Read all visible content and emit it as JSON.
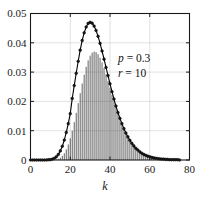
{
  "chart_data": {
    "type": "bar",
    "title": "",
    "subtitle": "",
    "xlabel": "k",
    "ylabel": "",
    "xlim": [
      0,
      80
    ],
    "ylim": [
      0,
      0.05
    ],
    "grid": true,
    "legend": null,
    "x_ticks": [
      "0",
      "20",
      "40",
      "60",
      "80"
    ],
    "x_tick_values": [
      0,
      20,
      40,
      60,
      80
    ],
    "y_ticks": [
      "0",
      "0.01",
      "0.02",
      "0.03",
      "0.04",
      "0.05"
    ],
    "y_tick_values": [
      0,
      0.01,
      0.02,
      0.03,
      0.04,
      0.05
    ],
    "marker": "circle",
    "stems": true,
    "annotations": [
      {
        "name": "p-annotation",
        "variable": "p",
        "equals": " = ",
        "value": "0.3",
        "x": 44,
        "y": 0.0335
      },
      {
        "name": "r-annotation",
        "variable": "r",
        "equals": " = ",
        "value": "10",
        "x": 44,
        "y": 0.0285
      }
    ],
    "categories": [
      0,
      1,
      2,
      3,
      4,
      5,
      6,
      7,
      8,
      9,
      10,
      11,
      12,
      13,
      14,
      15,
      16,
      17,
      18,
      19,
      20,
      21,
      22,
      23,
      24,
      25,
      26,
      27,
      28,
      29,
      30,
      31,
      32,
      33,
      34,
      35,
      36,
      37,
      38,
      39,
      40,
      41,
      42,
      43,
      44,
      45,
      46,
      47,
      48,
      49,
      50,
      51,
      52,
      53,
      54,
      55,
      56,
      57,
      58,
      59,
      60,
      61,
      62,
      63,
      64,
      65,
      66,
      67,
      68,
      69,
      70,
      71,
      72,
      73,
      74,
      75
    ],
    "values": [
      0.0,
      0.0,
      0.0,
      0.0,
      0.0,
      0.0,
      0.0,
      0.0,
      0.0,
      0.0,
      0.0,
      0.0,
      0.0001,
      0.0002,
      0.0004,
      0.0008,
      0.0014,
      0.0023,
      0.0036,
      0.0053,
      0.0074,
      0.01,
      0.0129,
      0.0161,
      0.0194,
      0.0228,
      0.0261,
      0.0291,
      0.0318,
      0.034,
      0.0356,
      0.0366,
      0.037,
      0.0368,
      0.0361,
      0.0349,
      0.0333,
      0.0314,
      0.0293,
      0.027,
      0.0247,
      0.0223,
      0.02,
      0.0178,
      0.0157,
      0.0137,
      0.0119,
      0.0103,
      0.0088,
      0.0075,
      0.0063,
      0.0053,
      0.0044,
      0.0037,
      0.003,
      0.0025,
      0.002,
      0.0017,
      0.0013,
      0.0011,
      0.0009,
      0.0007,
      0.0006,
      0.0004,
      0.0004,
      0.0003,
      0.0002,
      0.0002,
      0.0001,
      0.0001,
      0.0001,
      0.0001,
      0.0,
      0.0,
      0.0,
      0.0
    ],
    "curve_values": [
      0.0,
      0.0,
      0.0,
      0.0,
      0.0,
      0.0,
      0.0,
      0.0,
      0.0,
      0.0001,
      0.0001,
      0.0003,
      0.0006,
      0.0011,
      0.0019,
      0.0031,
      0.0047,
      0.0068,
      0.0094,
      0.0124,
      0.0158,
      0.021,
      0.0254,
      0.0296,
      0.0337,
      0.0375,
      0.0408,
      0.0434,
      0.0454,
      0.0466,
      0.047,
      0.0467,
      0.0457,
      0.0442,
      0.0422,
      0.0398,
      0.0372,
      0.0344,
      0.0316,
      0.0288,
      0.026,
      0.0233,
      0.0208,
      0.0184,
      0.0162,
      0.0142,
      0.0124,
      0.0107,
      0.0092,
      0.0079,
      0.0067,
      0.0057,
      0.0048,
      0.004,
      0.0034,
      0.0028,
      0.0023,
      0.0019,
      0.0016,
      0.0013,
      0.0011,
      0.0009,
      0.0007,
      0.0006,
      0.0005,
      0.0004,
      0.0003,
      0.0003,
      0.0002,
      0.0002,
      0.0001,
      0.0001,
      0.0001,
      0.0001,
      0.0001,
      0.0
    ]
  },
  "colors": {
    "axis": "#1a1a1a",
    "grid": "#d6d6d6",
    "stem": "#2b2b2b",
    "marker_fill": "#1a1a1a",
    "marker_stroke": "#000000",
    "curve": "#000000",
    "background": "#ffffff"
  }
}
